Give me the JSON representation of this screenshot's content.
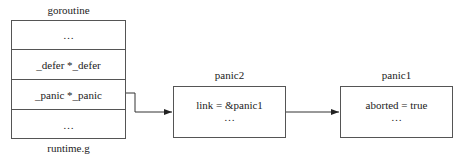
{
  "goroutine": {
    "title": "goroutine",
    "footer": "runtime.g",
    "rows": [
      "…",
      "_defer *_defer",
      "_panic *_panic",
      "…"
    ]
  },
  "panic2": {
    "title": "panic2",
    "lines": [
      "link = &panic1",
      "…"
    ]
  },
  "panic1": {
    "title": "panic1",
    "lines": [
      "aborted = true",
      "…"
    ]
  }
}
